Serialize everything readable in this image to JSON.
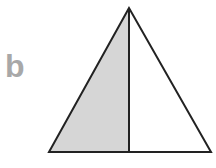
{
  "figure": {
    "label": "b",
    "label_color": "#a8a8a8",
    "triangle": {
      "apex": [
        129,
        8
      ],
      "base_left": [
        49,
        152
      ],
      "base_right": [
        211,
        152
      ],
      "divider_x": 129,
      "stroke_color": "#222222",
      "shaded_fill": "#d6d6d6",
      "unshaded_fill": "#ffffff"
    }
  }
}
